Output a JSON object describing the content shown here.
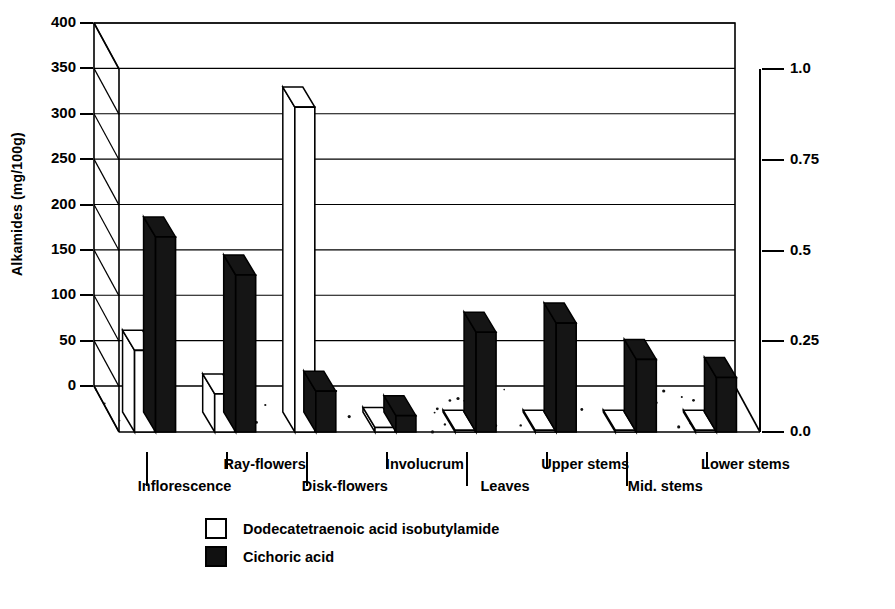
{
  "chart_data": {
    "type": "bar",
    "title": "",
    "subtitle": "",
    "categories": [
      "Inflorescence",
      "Ray-flowers",
      "Disk-flowers",
      "Involucrum",
      "Leaves",
      "Upper stems",
      "Mid. stems",
      "Lower stems"
    ],
    "series": [
      {
        "name": "Dodecatetraenoic  acid isobutylamide",
        "axis": "left",
        "units": "mg/100g",
        "color": "#ffffff",
        "values": [
          90,
          42,
          358,
          5,
          2,
          2,
          2,
          2
        ]
      },
      {
        "name": "Cichoric acid",
        "axis": "right",
        "units": "g/100g",
        "color": "#111111",
        "values_left_scale": [
          215,
          173,
          45,
          18,
          110,
          120,
          80,
          60
        ],
        "values": [
          0.54,
          0.43,
          0.11,
          0.045,
          0.275,
          0.3,
          0.2,
          0.15
        ]
      }
    ],
    "xlabel": "",
    "ylabel": "Alkamides (mg/100g)",
    "ylabel_right": "Cichoric acid (g/100g)",
    "ylim": [
      0,
      400
    ],
    "ylim_right": [
      0.0,
      1.0
    ],
    "yticks": [
      "0",
      "50",
      "100",
      "150",
      "200",
      "250",
      "300",
      "350",
      "400"
    ],
    "yticks_right": [
      "0.0",
      "0.25",
      "0.5",
      "0.75",
      "1.0"
    ],
    "grid": true,
    "legend_position": "bottom-left",
    "style": "3d-bar"
  },
  "axes": {
    "left_title": "Alkamides (mg/100g)",
    "right_title": "Cichoric acid (g/100g)",
    "left_ticks": [
      "400",
      "350",
      "300",
      "250",
      "200",
      "150",
      "100",
      "50",
      "0"
    ],
    "right_ticks": [
      "1.0",
      "0.75",
      "0.5",
      "0.25",
      "0.0"
    ]
  },
  "categories": [
    {
      "label": "Inflorescence",
      "row": "lower"
    },
    {
      "label": "Ray-flowers",
      "row": "upper"
    },
    {
      "label": "Disk-flowers",
      "row": "lower"
    },
    {
      "label": "Involucrum",
      "row": "upper"
    },
    {
      "label": "Leaves",
      "row": "lower"
    },
    {
      "label": "Upper stems",
      "row": "upper"
    },
    {
      "label": "Mid. stems",
      "row": "lower"
    },
    {
      "label": "Lower stems",
      "row": "upper"
    }
  ],
  "legend": {
    "items": [
      {
        "label": "Dodecatetraenoic  acid isobutylamide",
        "swatch": "empty"
      },
      {
        "label": "Cichoric acid",
        "swatch": "filled"
      }
    ]
  }
}
